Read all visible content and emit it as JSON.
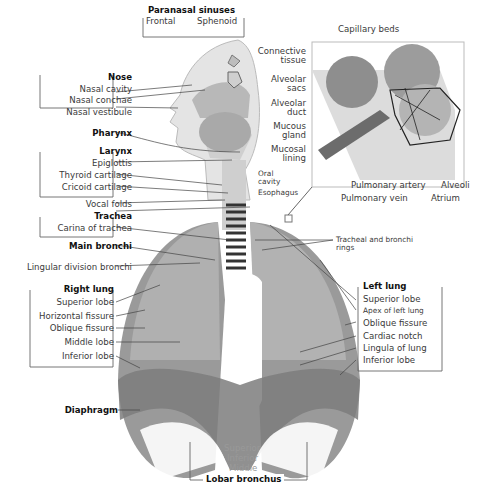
{
  "diagram": {
    "groups": {
      "paranasal_sinuses": {
        "heading": "Paranasal sinuses",
        "items": [
          "Frontal",
          "Sphenoid"
        ]
      },
      "nose": {
        "heading": "Nose",
        "items": [
          "Nasal cavity",
          "Nasal conchae",
          "Nasal vestibule"
        ]
      },
      "pharynx": {
        "heading": "Pharynx"
      },
      "larynx": {
        "heading": "Larynx",
        "items": [
          "Epiglottis",
          "Thyroid cartilage",
          "Cricoid cartilage"
        ]
      },
      "vocal_folds": {
        "label": "Vocal folds"
      },
      "trachea": {
        "heading": "Trachea",
        "items": [
          "Carina of trachea"
        ]
      },
      "main_bronchi": {
        "heading": "Main bronchi"
      },
      "lingular": {
        "label": "Lingular division bronchi"
      },
      "right_lung": {
        "heading": "Right lung",
        "items": [
          "Superior lobe",
          "Horizontal fissure",
          "Oblique fissure",
          "Middle lobe",
          "Inferior lobe"
        ]
      },
      "diaphragm": {
        "heading": "Diaphragm"
      },
      "lobar_bronchus": {
        "heading": "Lobar bronchus",
        "items": [
          "Superior",
          "Inferior",
          "Middle"
        ]
      },
      "left_lung": {
        "heading": "Left lung",
        "items": [
          "Superior lobe",
          "Apex of left lung",
          "Oblique fissure",
          "Cardiac notch",
          "Lingula of lung",
          "Inferior lobe"
        ]
      },
      "tracheal_rings": {
        "label_line1": "Tracheal and bronchi",
        "label_line2": "rings"
      },
      "oral_cavity": {
        "line1": "Oral",
        "line2": "cavity"
      },
      "esophagus": {
        "label": "Esophagus"
      },
      "alveolus_inset": {
        "capillary_beds": "Capillary beds",
        "connective_tissue": [
          "Connective",
          "tissue"
        ],
        "alveolar_sacs": [
          "Alveolar",
          "sacs"
        ],
        "alveolar_duct": [
          "Alveolar",
          "duct"
        ],
        "mucous_gland": [
          "Mucous",
          "gland"
        ],
        "mucosal_lining": [
          "Mucosal",
          "lining"
        ],
        "pulmonary_artery": "Pulmonary artery",
        "pulmonary_vein": "Pulmonary vein",
        "alveoli": "Alveoli",
        "atrium": "Atrium"
      }
    },
    "colors": {
      "tissue_light": "#d6d6d6",
      "tissue_mid": "#a8a8a8",
      "tissue_dark": "#7a7a7a",
      "line": "#444444",
      "frame": "#777777"
    }
  }
}
